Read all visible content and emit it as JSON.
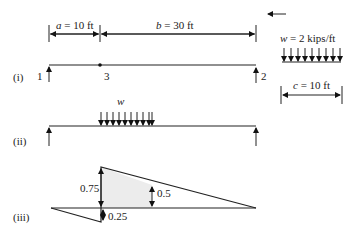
{
  "figure": {
    "dimensions": {
      "a_label_var": "a",
      "a_label_val": " = 10 ft",
      "b_label_var": "b",
      "b_label_val": " = 30 ft",
      "c_label_var": "c",
      "c_label_val": " = 10 ft"
    },
    "load": {
      "w_label_var": "w",
      "w_label_val": " = 2 kips/ft",
      "arrow_count": 9
    },
    "panel_i": {
      "label": "(i)",
      "node_1": "1",
      "node_2": "2",
      "node_3": "3"
    },
    "panel_ii": {
      "label": "(ii)",
      "w_label": "w"
    },
    "panel_iii": {
      "label": "(iii)",
      "ordinate_075": "0.75",
      "ordinate_05": "0.5",
      "ordinate_025": "0.25"
    }
  }
}
